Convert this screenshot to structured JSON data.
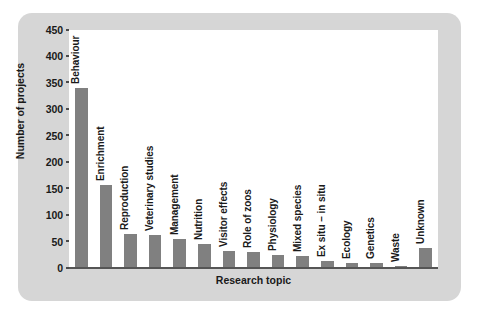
{
  "chart_data": {
    "type": "bar",
    "title": "",
    "xlabel": "Research topic",
    "ylabel": "Number of projects",
    "ylim": [
      0,
      450
    ],
    "ytick_step": 50,
    "yticks": [
      "450",
      "400",
      "350",
      "300",
      "250",
      "200",
      "150",
      "100",
      "50",
      "0"
    ],
    "grid": false,
    "legend": null,
    "categories": [
      "Behaviour",
      "Enrichment",
      "Reproduction",
      "Veterinary studies",
      "Management",
      "Nutrition",
      "Visitor effects",
      "Role of zoos",
      "Physiology",
      "Mixed species",
      "Ex situ – in situ",
      "Ecology",
      "Genetics",
      "Waste",
      "Unknown"
    ],
    "values": [
      340,
      157,
      65,
      62,
      55,
      45,
      32,
      30,
      25,
      22,
      13,
      10,
      10,
      4,
      38
    ],
    "bar_color": "#808080",
    "panel_color": "#d6d6d6",
    "plot_background": "#ffffff",
    "text_color": "#1a1a1a"
  }
}
